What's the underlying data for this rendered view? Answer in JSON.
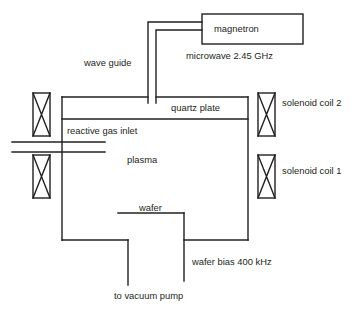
{
  "diagram": {
    "stroke_color": "#231f20",
    "background_color": "#ffffff",
    "labels": {
      "magnetron": "magnetron",
      "microwave_frequency": "microwave 2.45 GHz",
      "wave_guide": "wave guide",
      "quartz_plate": "quartz plate",
      "solenoid_coil_2": "solenoid coil 2",
      "reactive_gas_inlet": "reactive gas inlet",
      "plasma": "plasma",
      "solenoid_coil_1": "solenoid coil 1",
      "wafer": "wafer",
      "wafer_bias": "wafer bias 400 kHz",
      "vacuum_pump": "to vacuum pump"
    },
    "components": [
      {
        "name": "magnetron-box",
        "type": "rectangle",
        "x": 202,
        "y": 14,
        "width": 101,
        "height": 30
      },
      {
        "name": "wave-guide-duct",
        "type": "double-line-duct"
      },
      {
        "name": "chamber-body",
        "type": "rectangle"
      },
      {
        "name": "quartz-plate-band",
        "type": "horizontal-band"
      },
      {
        "name": "solenoid-coil-upper-left",
        "type": "coil",
        "x": 33,
        "y": 93,
        "width": 17,
        "height": 43
      },
      {
        "name": "solenoid-coil-upper-right",
        "type": "coil",
        "x": 258,
        "y": 93,
        "width": 17,
        "height": 43
      },
      {
        "name": "solenoid-coil-lower-left",
        "type": "coil",
        "x": 33,
        "y": 155,
        "width": 17,
        "height": 43
      },
      {
        "name": "solenoid-coil-lower-right",
        "type": "coil",
        "x": 258,
        "y": 155,
        "width": 17,
        "height": 43
      },
      {
        "name": "reactive-gas-inlet-pipe",
        "type": "double-line"
      },
      {
        "name": "wafer-stage",
        "type": "line"
      },
      {
        "name": "wafer-bias-electrode",
        "type": "line"
      },
      {
        "name": "vacuum-pump-line",
        "type": "line"
      }
    ]
  }
}
